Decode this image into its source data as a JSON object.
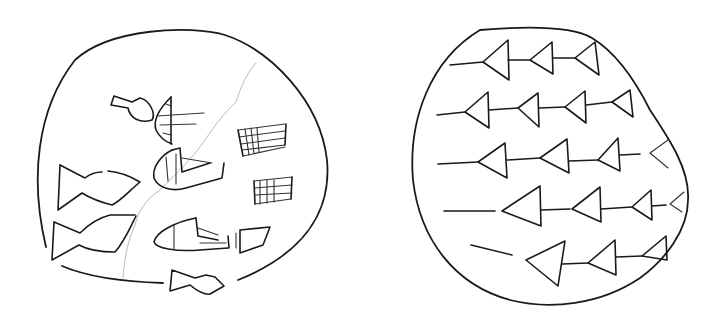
{
  "figure": {
    "colors": {
      "ink": "#1a1a1a",
      "crack": "#a8a8a8",
      "background": "#ffffff"
    }
  },
  "tablets": [
    {
      "id": "left",
      "signs": [
        {
          "type": "head-with-vessel",
          "count": 1
        },
        {
          "type": "boat-sign",
          "count": 2
        },
        {
          "type": "grid-sign",
          "count": 2
        },
        {
          "type": "fish-sign",
          "count": 3
        },
        {
          "type": "diamond-sign",
          "count": 1
        }
      ],
      "has_crack": true
    },
    {
      "id": "right",
      "rows": [
        {
          "row": 1,
          "wedges": 3
        },
        {
          "row": 2,
          "wedges": 4
        },
        {
          "row": 3,
          "wedges": 4
        },
        {
          "row": 4,
          "wedges": 4
        },
        {
          "row": 5,
          "wedges": 3
        }
      ],
      "sign_type": "arrow-wedge"
    }
  ]
}
